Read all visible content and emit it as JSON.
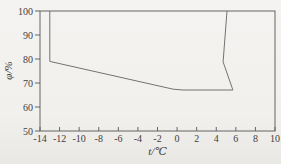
{
  "figure": {
    "background": "#f1f0ed",
    "frame_color": "#646464",
    "curve_color": "#737373",
    "text_color": "#3e3e3e"
  },
  "chart_data": {
    "type": "line",
    "title": "",
    "xlabel": "t/℃",
    "ylabel": "φ/%",
    "xlim": [
      -14,
      10
    ],
    "ylim": [
      50,
      100
    ],
    "x_ticks": [
      -14,
      -12,
      -10,
      -8,
      -6,
      -4,
      -2,
      0,
      2,
      4,
      6,
      8,
      10
    ],
    "y_ticks": [
      50,
      60,
      70,
      80,
      90,
      100
    ],
    "grid": false,
    "legend": "none",
    "series": [
      {
        "name": "region-boundary",
        "closed_by_top_frame": true,
        "points": [
          [
            -13,
            100
          ],
          [
            -13,
            79
          ],
          [
            -0.4,
            67.4
          ],
          [
            0.6,
            67.1
          ],
          [
            5.7,
            67.1
          ],
          [
            4.7,
            78.8
          ],
          [
            5.1,
            100
          ]
        ]
      }
    ]
  }
}
